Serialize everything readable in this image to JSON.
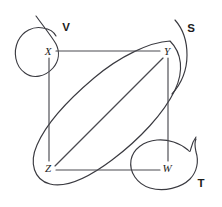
{
  "figure": {
    "background_color": "#ffffff",
    "line_color": "#4a4a50",
    "text_color": "#1c1c1c",
    "width": 222,
    "height": 207
  },
  "vertices": [
    {
      "id": "X",
      "label": "X",
      "x": 48,
      "y": 52
    },
    {
      "id": "Y",
      "label": "Y",
      "x": 167,
      "y": 52
    },
    {
      "id": "Z",
      "label": "Z",
      "x": 48,
      "y": 168
    },
    {
      "id": "W",
      "label": "W",
      "x": 167,
      "y": 168
    }
  ],
  "edges": [
    {
      "id": "XY",
      "from": "X",
      "to": "Y",
      "path": "M 56 51 L 160 51"
    },
    {
      "id": "XZ",
      "from": "X",
      "to": "Z",
      "path": "M 49 58 L 49 161"
    },
    {
      "id": "YW",
      "from": "Y",
      "to": "W",
      "path": "M 168 58 L 168 161"
    },
    {
      "id": "ZW",
      "from": "Z",
      "to": "W",
      "path": "M 56 170 L 160 170"
    },
    {
      "id": "ZY",
      "from": "Z",
      "to": "Y",
      "path": "M 55 166 L 163 58"
    }
  ],
  "sets": [
    {
      "id": "V",
      "label": "V",
      "label_x": 66,
      "label_y": 31,
      "encloses": [
        "X"
      ],
      "path": "M 36 16 C 44 27 52 37 56 44 C 60 52 59 61 53 68 C 45 77 33 79 25 73 C 15 66 13 52 18 41 C 23 31 33 26 43 28 C 50 29 54 32 56 36"
    },
    {
      "id": "S",
      "label": "S",
      "label_x": 191,
      "label_y": 32,
      "encloses": [
        "Y"
      ],
      "path": "M 175 20 C 183 29 187 42 187 55 C 187 70 181 84 172 94"
    },
    {
      "id": "T",
      "label": "T",
      "label_x": 201,
      "label_y": 187,
      "encloses": [
        "W"
      ],
      "path": "M 196 137 C 189 146 192 155 188 150 C 180 143 168 139 157 140 C 144 141 133 149 131 160 C 129 172 137 184 150 188 C 164 192 181 188 190 179 C 197 172 199 161 196 152 C 195 147 194 143 196 139"
    },
    {
      "id": "bigoval",
      "label": "",
      "label_x": 0,
      "label_y": 0,
      "encloses": [
        "Z",
        "Y"
      ],
      "path": "M 170 41 C 150 42 120 56 94 78 C 68 100 46 124 37 145 C 29 163 34 180 50 184 C 66 188 88 178 112 160 C 140 139 164 113 175 90 C 184 71 182 53 170 41 Z"
    }
  ]
}
